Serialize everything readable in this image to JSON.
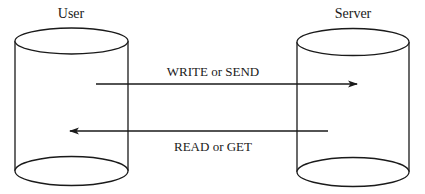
{
  "diagram": {
    "nodes": [
      {
        "id": "user",
        "label": "User",
        "shape": "cylinder"
      },
      {
        "id": "server",
        "label": "Server",
        "shape": "cylinder"
      }
    ],
    "edges": [
      {
        "from": "user",
        "to": "server",
        "label": "WRITE or SEND"
      },
      {
        "from": "server",
        "to": "user",
        "label": "READ or GET"
      }
    ],
    "colors": {
      "stroke": "#1a1a1a",
      "background": "#ffffff"
    }
  }
}
